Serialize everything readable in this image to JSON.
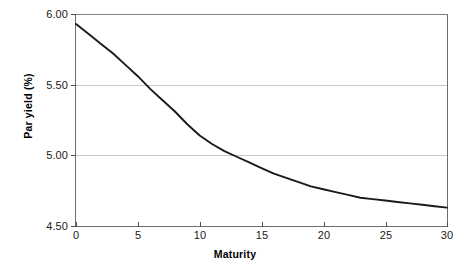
{
  "chart_data": {
    "type": "line",
    "title": "",
    "subtitle": "",
    "xlabel": "Maturity",
    "ylabel": "Par yield (%)",
    "xlim": [
      0,
      30
    ],
    "ylim": [
      4.5,
      6.0
    ],
    "xticks": [
      "0",
      "5",
      "10",
      "15",
      "20",
      "25",
      "30"
    ],
    "yticks": [
      "6.00",
      "5.50",
      "5.00",
      "4.50"
    ],
    "xtick_values": [
      0,
      5,
      10,
      15,
      20,
      25,
      30
    ],
    "ytick_values": [
      6.0,
      5.5,
      5.0,
      4.5
    ],
    "grid": "horizontal",
    "legend": "none",
    "series": [
      {
        "name": "Par yield curve",
        "color": "#1a1a1a",
        "x": [
          0,
          1,
          2,
          3,
          4,
          5,
          6,
          7,
          8,
          9,
          10,
          11,
          12,
          13,
          14,
          15,
          16,
          17,
          18,
          19,
          20,
          21,
          22,
          23,
          24,
          25,
          26,
          27,
          28,
          29,
          30
        ],
        "y": [
          5.93,
          5.86,
          5.79,
          5.72,
          5.64,
          5.56,
          5.47,
          5.39,
          5.31,
          5.22,
          5.14,
          5.08,
          5.03,
          4.99,
          4.95,
          4.91,
          4.87,
          4.84,
          4.81,
          4.78,
          4.76,
          4.74,
          4.72,
          4.7,
          4.69,
          4.68,
          4.67,
          4.66,
          4.65,
          4.64,
          4.63
        ]
      }
    ],
    "annotations": []
  },
  "style": {
    "line_color": "#1a1a1a",
    "grid_color": "#c9c9c9",
    "axis_color": "#6e6e6e",
    "background": "#ffffff"
  }
}
